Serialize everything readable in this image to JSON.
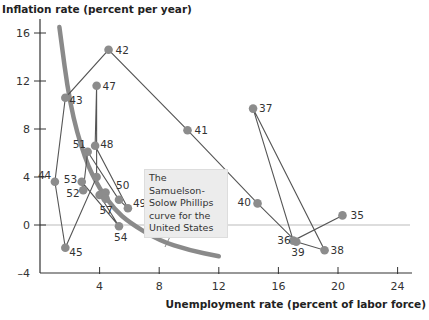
{
  "chart_data": {
    "type": "scatter",
    "title": "",
    "xlabel": "Unemployment rate (percent of labor force)",
    "ylabel": "Inflation rate (percent per year)",
    "xlim": [
      0,
      25
    ],
    "ylim": [
      -4,
      17
    ],
    "x_ticks": [
      4,
      8,
      12,
      16,
      20,
      24
    ],
    "y_ticks": [
      -4,
      0,
      4,
      8,
      12,
      16
    ],
    "grid": false,
    "zero_line": true,
    "series": [
      {
        "name": "US inflation vs unemployment 1935-1957 (connected by year)",
        "points": [
          {
            "year": "35",
            "x": 20.3,
            "y": 0.8
          },
          {
            "year": "36",
            "x": 17.0,
            "y": -1.3
          },
          {
            "year": "37",
            "x": 14.3,
            "y": 9.7
          },
          {
            "year": "38",
            "x": 19.1,
            "y": -2.1
          },
          {
            "year": "39",
            "x": 17.2,
            "y": -1.4
          },
          {
            "year": "40",
            "x": 14.6,
            "y": 1.8
          },
          {
            "year": "41",
            "x": 9.9,
            "y": 7.9
          },
          {
            "year": "42",
            "x": 4.6,
            "y": 14.6
          },
          {
            "year": "43",
            "x": 1.7,
            "y": 10.6
          },
          {
            "year": "44",
            "x": 1.0,
            "y": 3.6
          },
          {
            "year": "45",
            "x": 1.7,
            "y": -1.9
          },
          {
            "year": "46",
            "x": 3.8,
            "y": 4.0
          },
          {
            "year": "47",
            "x": 3.8,
            "y": 11.6
          },
          {
            "year": "48",
            "x": 3.7,
            "y": 6.6
          },
          {
            "year": "49",
            "x": 5.9,
            "y": 1.4
          },
          {
            "year": "50",
            "x": 5.3,
            "y": 2.1
          },
          {
            "year": "51",
            "x": 3.2,
            "y": 6.1
          },
          {
            "year": "52",
            "x": 2.9,
            "y": 2.9
          },
          {
            "year": "53",
            "x": 2.8,
            "y": 3.6
          },
          {
            "year": "54",
            "x": 5.3,
            "y": -0.1
          },
          {
            "year": "55",
            "x": 4.0,
            "y": 2.5
          },
          {
            "year": "56",
            "x": 4.4,
            "y": 2.7
          },
          {
            "year": "57",
            "x": 4.4,
            "y": 2.2
          }
        ],
        "labeled_years": [
          "35",
          "36",
          "37",
          "38",
          "39",
          "40",
          "41",
          "42",
          "43",
          "44",
          "45",
          "47",
          "48",
          "49",
          "50",
          "51",
          "52",
          "53",
          "54",
          "57"
        ]
      },
      {
        "name": "The Samuelson-Solow Phillips curve for the United States",
        "type": "curve",
        "points": [
          [
            1.3,
            16.5
          ],
          [
            2,
            10
          ],
          [
            3,
            5.5
          ],
          [
            4,
            3
          ],
          [
            5,
            1.3
          ],
          [
            6,
            0.2
          ],
          [
            8,
            -1.3
          ],
          [
            10,
            -2.1
          ],
          [
            12,
            -2.6
          ]
        ]
      }
    ],
    "annotations": [
      "The Samuelson-Solow Phillips curve for the United States"
    ]
  },
  "labels": {
    "ytitle": "Inflation rate (percent per year)",
    "xtitle": "Unemployment rate (percent of labor force)",
    "callout": "The Samuelson-Solow Phillips curve for the United States"
  },
  "colors": {
    "points": "#8c8c8c",
    "curve": "#8a8a8a",
    "line": "#555555",
    "axis": "#333333",
    "zero": "#bbbbbb"
  }
}
